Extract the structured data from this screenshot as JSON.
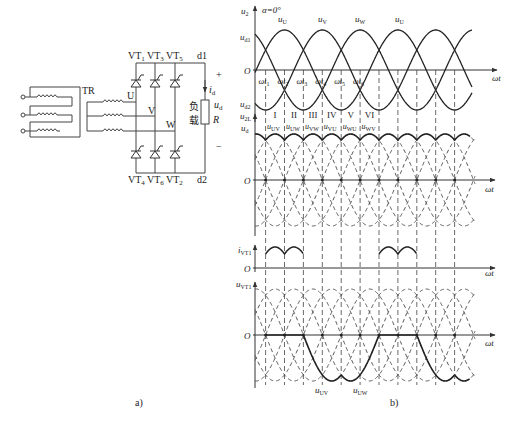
{
  "panel_a": {
    "caption": "a)",
    "transformer_label": "TR",
    "phases": [
      "U",
      "V",
      "W"
    ],
    "top_thyristors": [
      "VT1",
      "VT3",
      "VT5"
    ],
    "bottom_thyristors": [
      "VT4",
      "VT6",
      "VT2"
    ],
    "dc_top_node": "d1",
    "dc_bottom_node": "d2",
    "current_label": "i_d",
    "voltage_label": "u_d",
    "plus": "+",
    "minus": "−",
    "load_label_cn": "负载",
    "load_label_cn_1": "负",
    "load_label_cn_2": "载",
    "resistor_label": "R"
  },
  "panel_b": {
    "caption": "b)",
    "alpha_label": "α=0°",
    "x_axis_label": "ωt",
    "origin_label": "O",
    "time_marks": [
      "ωt1",
      "ωt2",
      "ωt3",
      "ωt4",
      "ωt5",
      "ωt6"
    ],
    "intervals": [
      "I",
      "II",
      "III",
      "IV",
      "V",
      "VI"
    ],
    "interval_line_voltages": [
      "u_UV",
      "u_UW",
      "u_VW",
      "u_VU",
      "u_WU",
      "u_WV"
    ]
  },
  "chart_data": [
    {
      "type": "line",
      "title": "Phase voltages u2 and output envelopes",
      "ylabel": "u2",
      "xlabel": "ωt",
      "y_annotations": [
        "u_d1",
        "u_d2"
      ],
      "series": [
        {
          "name": "u_U",
          "phase_deg": 0,
          "amplitude": 1
        },
        {
          "name": "u_V",
          "phase_deg": -120,
          "amplitude": 1
        },
        {
          "name": "u_W",
          "phase_deg": 120,
          "amplitude": 1
        }
      ],
      "peak_labels": [
        "u_U",
        "u_V",
        "u_W",
        "u_U"
      ]
    },
    {
      "type": "line",
      "title": "Line voltages u2L and output u_d",
      "ylabel": "u2L / u_d",
      "xlabel": "ωt",
      "series": [
        {
          "name": "u_UV"
        },
        {
          "name": "u_UW"
        },
        {
          "name": "u_VW"
        },
        {
          "name": "u_VU"
        },
        {
          "name": "u_WU"
        },
        {
          "name": "u_WV"
        }
      ],
      "bold_series": "u_d (upper envelope)"
    },
    {
      "type": "line",
      "title": "Thyristor VT1 current",
      "ylabel": "i_VT1",
      "xlabel": "ωt",
      "conduction_intervals": [
        "I",
        "II"
      ]
    },
    {
      "type": "line",
      "title": "Thyristor VT1 voltage",
      "ylabel": "u_VT1",
      "xlabel": "ωt",
      "bold_segments": [
        "0 (I, II)",
        "u_UV (III, IV)",
        "u_UW (V, VI)"
      ],
      "bottom_labels": [
        "u_UV",
        "u_UW"
      ]
    }
  ]
}
